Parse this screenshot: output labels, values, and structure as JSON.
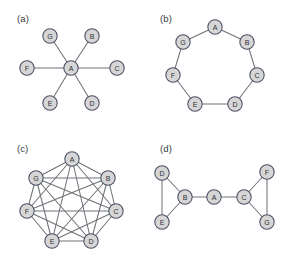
{
  "figure": {
    "background_color": "#ffffff",
    "node_fill_color": "#d6d6d6",
    "node_stroke_color": "#4a4f63",
    "edge_color": "#6f7278",
    "label_color": "#3a3a3a",
    "node_radius": 7.2,
    "width": 286,
    "height": 260
  },
  "chart_data": {
    "type": "diagram",
    "title": "",
    "subtitle": "",
    "xlabel": "",
    "ylabel": "",
    "legend": [],
    "panels": [
      {
        "id": "a",
        "label": "(a)",
        "label_x": 17,
        "label_y": 22,
        "graph_type": "star",
        "description": "Star graph: hub A connected to all six peripheral nodes",
        "node_count": 7,
        "edge_count": 6,
        "nodes": [
          {
            "id": "A",
            "x": 71,
            "y": 68
          },
          {
            "id": "B",
            "x": 92,
            "y": 36
          },
          {
            "id": "C",
            "x": 117,
            "y": 68
          },
          {
            "id": "D",
            "x": 92,
            "y": 103
          },
          {
            "id": "E",
            "x": 50,
            "y": 103
          },
          {
            "id": "F",
            "x": 27,
            "y": 68
          },
          {
            "id": "G",
            "x": 50,
            "y": 36
          }
        ],
        "edges": [
          [
            "A",
            "B"
          ],
          [
            "A",
            "C"
          ],
          [
            "A",
            "D"
          ],
          [
            "A",
            "E"
          ],
          [
            "A",
            "F"
          ],
          [
            "A",
            "G"
          ]
        ]
      },
      {
        "id": "b",
        "label": "(b)",
        "label_x": 17,
        "label_y": 22,
        "graph_type": "ring",
        "description": "Ring / cycle graph: A-B-C-D-E-F-G-A",
        "node_count": 7,
        "edge_count": 7,
        "nodes": [
          {
            "id": "A",
            "x": 72,
            "y": 27
          },
          {
            "id": "B",
            "x": 104,
            "y": 42
          },
          {
            "id": "C",
            "x": 114,
            "y": 75
          },
          {
            "id": "D",
            "x": 92,
            "y": 104
          },
          {
            "id": "E",
            "x": 52,
            "y": 104
          },
          {
            "id": "F",
            "x": 30,
            "y": 75
          },
          {
            "id": "G",
            "x": 40,
            "y": 42
          }
        ],
        "edges": [
          [
            "A",
            "B"
          ],
          [
            "B",
            "C"
          ],
          [
            "C",
            "D"
          ],
          [
            "D",
            "E"
          ],
          [
            "E",
            "F"
          ],
          [
            "F",
            "G"
          ],
          [
            "G",
            "A"
          ]
        ]
      },
      {
        "id": "c",
        "label": "(c)",
        "label_x": 17,
        "label_y": 22,
        "graph_type": "complete",
        "description": "Complete graph K7: every node connected to every other node",
        "node_count": 7,
        "edge_count": 21,
        "nodes": [
          {
            "id": "A",
            "x": 72,
            "y": 29
          },
          {
            "id": "B",
            "x": 108,
            "y": 48
          },
          {
            "id": "C",
            "x": 116,
            "y": 81
          },
          {
            "id": "D",
            "x": 91,
            "y": 111
          },
          {
            "id": "E",
            "x": 52,
            "y": 111
          },
          {
            "id": "F",
            "x": 27,
            "y": 81
          },
          {
            "id": "G",
            "x": 36,
            "y": 48
          }
        ],
        "edges": [
          [
            "A",
            "B"
          ],
          [
            "A",
            "C"
          ],
          [
            "A",
            "D"
          ],
          [
            "A",
            "E"
          ],
          [
            "A",
            "F"
          ],
          [
            "A",
            "G"
          ],
          [
            "B",
            "C"
          ],
          [
            "B",
            "D"
          ],
          [
            "B",
            "E"
          ],
          [
            "B",
            "F"
          ],
          [
            "B",
            "G"
          ],
          [
            "C",
            "D"
          ],
          [
            "C",
            "E"
          ],
          [
            "C",
            "F"
          ],
          [
            "C",
            "G"
          ],
          [
            "D",
            "E"
          ],
          [
            "D",
            "F"
          ],
          [
            "D",
            "G"
          ],
          [
            "E",
            "F"
          ],
          [
            "E",
            "G"
          ],
          [
            "F",
            "G"
          ]
        ]
      },
      {
        "id": "d",
        "label": "(d)",
        "label_x": 17,
        "label_y": 22,
        "graph_type": "two-triangles-bridge",
        "description": "Two triangles (B,D,E and C,F,G) joined by a bridge node A",
        "node_count": 7,
        "edge_count": 8,
        "nodes": [
          {
            "id": "A",
            "x": 71,
            "y": 67
          },
          {
            "id": "B",
            "x": 42,
            "y": 67
          },
          {
            "id": "C",
            "x": 101,
            "y": 67
          },
          {
            "id": "D",
            "x": 19,
            "y": 43
          },
          {
            "id": "E",
            "x": 19,
            "y": 92
          },
          {
            "id": "F",
            "x": 124,
            "y": 42
          },
          {
            "id": "G",
            "x": 124,
            "y": 92
          }
        ],
        "edges": [
          [
            "A",
            "B"
          ],
          [
            "A",
            "C"
          ],
          [
            "B",
            "D"
          ],
          [
            "B",
            "E"
          ],
          [
            "D",
            "E"
          ],
          [
            "C",
            "F"
          ],
          [
            "C",
            "G"
          ],
          [
            "F",
            "G"
          ]
        ]
      }
    ]
  }
}
